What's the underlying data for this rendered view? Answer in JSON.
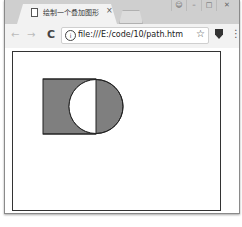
{
  "window": {
    "tab_title": "绘制一个叠加图形",
    "tab_close": "×",
    "controls": {
      "user": "&#9786;",
      "minimize": "–",
      "maximize": "□",
      "close": "✕"
    }
  },
  "toolbar": {
    "back": "←",
    "forward": "→",
    "reload": "C",
    "info": "i",
    "url": "file:///E:/code/10/path.htm",
    "star": "☆",
    "menu": "⋮"
  },
  "canvas": {
    "rect": {
      "x": 30,
      "y": 27,
      "width": 53,
      "height": 55,
      "fill": "#7f7f7f",
      "stroke": "#222222"
    },
    "circle": {
      "cx": 83,
      "cy": 54.5,
      "r": 27,
      "fill": "#7f7f7f",
      "stroke": "#222222"
    },
    "overlap_fill": "#ffffff"
  }
}
